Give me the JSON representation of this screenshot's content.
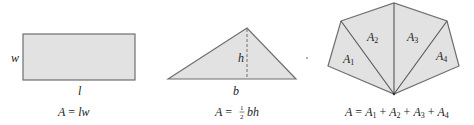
{
  "colors": {
    "fill": "#e2e2e2",
    "stroke": "#6f6f6f",
    "text": "#222222",
    "background": "#ffffff"
  },
  "figures": [
    {
      "shape": "rectangle",
      "side_label": "w",
      "bottom_label": "l",
      "formula": {
        "lhs": "A",
        "eq": " = ",
        "rhs": "lw"
      }
    },
    {
      "shape": "triangle",
      "height_label": "h",
      "base_label": "b",
      "formula": {
        "lhs": "A",
        "eq": " = ",
        "num": "1",
        "den": "2",
        "rhs": "bh"
      }
    },
    {
      "shape": "polygon-divided-into-triangles",
      "region_labels": [
        {
          "base": "A",
          "sub": "1"
        },
        {
          "base": "A",
          "sub": "2"
        },
        {
          "base": "A",
          "sub": "3"
        },
        {
          "base": "A",
          "sub": "4"
        }
      ],
      "formula": {
        "lhs": "A",
        "eq": " = ",
        "terms": [
          {
            "base": "A",
            "sub": "1"
          },
          {
            "base": "A",
            "sub": "2"
          },
          {
            "base": "A",
            "sub": "3"
          },
          {
            "base": "A",
            "sub": "4"
          }
        ],
        "op": " + "
      }
    }
  ]
}
